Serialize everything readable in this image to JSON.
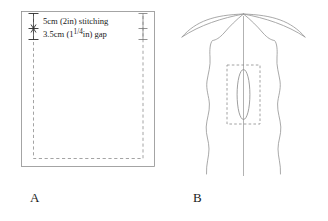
{
  "figure": {
    "background_color": "#ffffff",
    "ink_color": "#1a1a1a",
    "line_color": "#8e8e8e",
    "panels": [
      {
        "caption": "A",
        "description": "flat rectangular panel with dashed stitching guide"
      },
      {
        "caption": "B",
        "description": "back view of garment with centre seam, dashed guide box and vent opening"
      }
    ]
  },
  "panel_a": {
    "caption": "A",
    "annotations": {
      "stitching": "5cm (2in) stitching",
      "gap_prefix": "3.5cm (1",
      "gap_fraction": "1/4",
      "gap_suffix": "in) gap"
    },
    "dimension_marks": {
      "left_label": "stitch-and-gap dimension bracket",
      "right_label": "stitch-and-gap dimension bracket"
    }
  },
  "panel_b": {
    "caption": "B",
    "elements": {
      "centre_seam": "centre back seam line",
      "guide_box": "dashed placement box",
      "vent_opening": "vent opening oval"
    }
  }
}
